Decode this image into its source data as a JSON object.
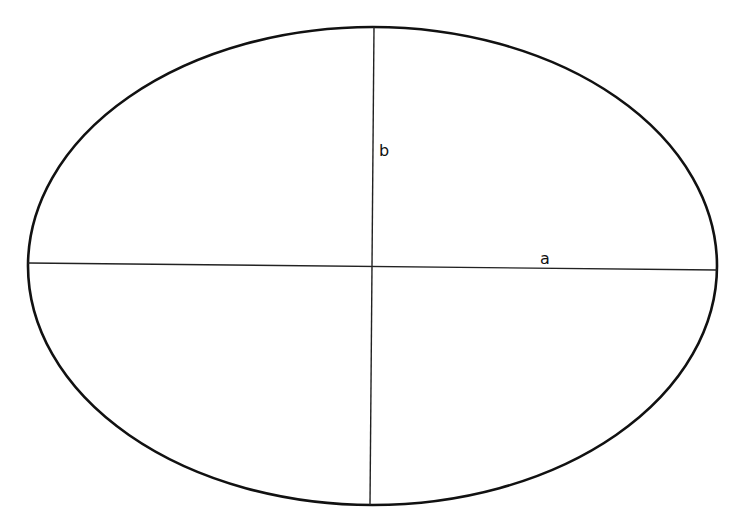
{
  "diagram": {
    "type": "ellipse-axes",
    "colors": {
      "stroke": "#111111",
      "background": "#ffffff"
    },
    "labels": {
      "semi_minor": "b",
      "semi_major": "a"
    }
  }
}
